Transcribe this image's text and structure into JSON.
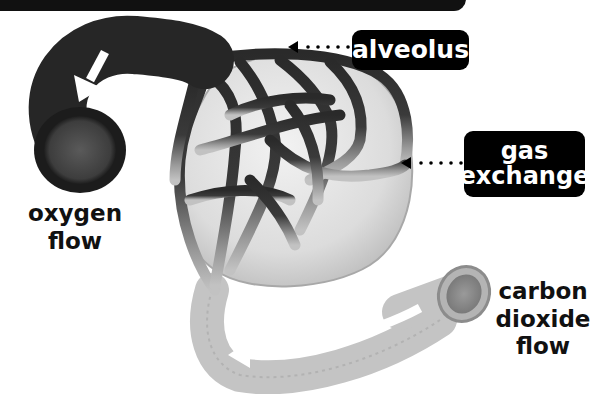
{
  "diagram": {
    "labels": {
      "alveolus": "alveolus",
      "gas_exchange_line1": "gas",
      "gas_exchange_line2": "exchange",
      "oxygen_line1": "oxygen",
      "oxygen_line2": "flow",
      "co2_line1": "carbon",
      "co2_line2": "dioxide",
      "co2_line3": "flow"
    },
    "colors": {
      "label_bg": "#000000",
      "label_text": "#ffffff",
      "oxygenated_vessel": "#2b2b2b",
      "deoxygenated_vessel": "#bdbdbd",
      "alveolus_fill": "#e4e4e4"
    }
  }
}
